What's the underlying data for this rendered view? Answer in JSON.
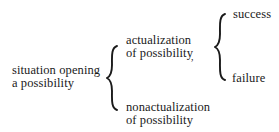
{
  "diagram": {
    "type": "tree",
    "root": {
      "line1": "situation opening",
      "line2": "a possibility"
    },
    "branch_actual": {
      "line1": "actualization",
      "line2": "of possibility",
      "mark": ","
    },
    "branch_nonactual": {
      "line1": "nonactualization",
      "line2": "of possibility"
    },
    "outcome_success": "success",
    "outcome_failure": "failure",
    "edges": [
      {
        "from": "situation opening a possibility",
        "to": "actualization of possibility"
      },
      {
        "from": "situation opening a possibility",
        "to": "nonactualization of possibility"
      },
      {
        "from": "actualization of possibility",
        "to": "success"
      },
      {
        "from": "actualization of possibility",
        "to": "failure"
      }
    ],
    "connector_style": "curly-brace",
    "text_color": "#1a1a1a",
    "background": "#ffffff"
  }
}
